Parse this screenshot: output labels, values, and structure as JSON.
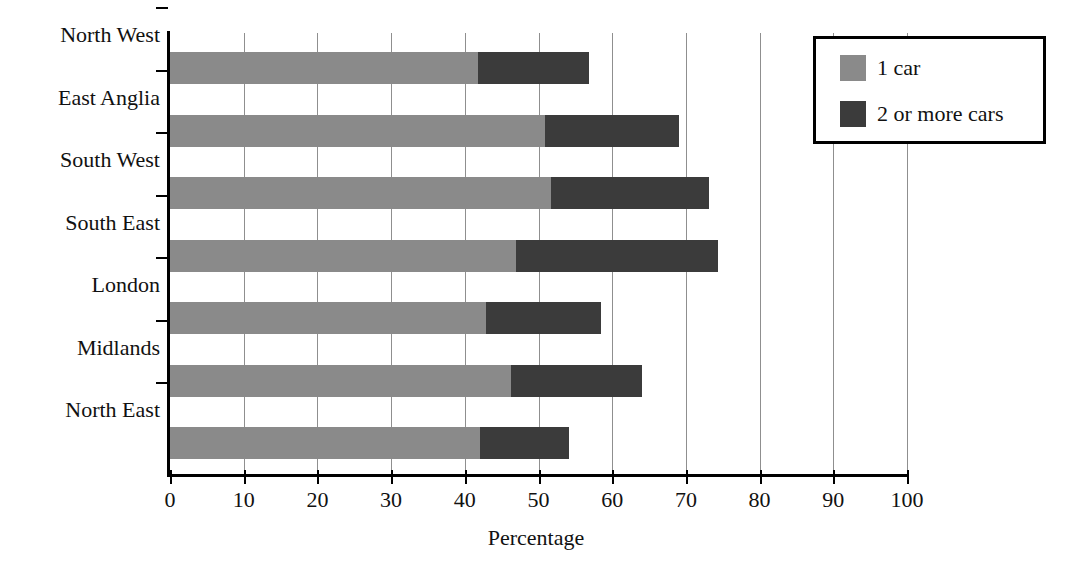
{
  "chart_data": {
    "type": "bar",
    "orientation": "horizontal",
    "stacked": true,
    "title": "",
    "xlabel": "Percentage",
    "ylabel": "",
    "xlim": [
      0,
      100
    ],
    "xticks": [
      "0",
      "10",
      "20",
      "30",
      "40",
      "50",
      "60",
      "70",
      "80",
      "90",
      "100"
    ],
    "grid": "vertical",
    "legend_position": "top-right",
    "categories": [
      "North West",
      "East Anglia",
      "South West",
      "South East",
      "London",
      "Midlands",
      "North East"
    ],
    "series": [
      {
        "name": "1 car",
        "color": "#8a8a8a",
        "values": [
          41.8,
          50.9,
          51.7,
          46.9,
          42.9,
          46.3,
          42.1
        ]
      },
      {
        "name": "2 or more cars",
        "color": "#3b3b3b",
        "values": [
          15.1,
          18.2,
          21.4,
          27.5,
          15.6,
          17.7,
          12.0
        ]
      }
    ],
    "totals": [
      56.9,
      69.1,
      73.1,
      74.4,
      58.5,
      64.0,
      54.1
    ]
  },
  "legend": {
    "items": [
      {
        "label": "1 car",
        "color": "#8a8a8a"
      },
      {
        "label": "2 or more cars",
        "color": "#3b3b3b"
      }
    ]
  },
  "colors": {
    "one_car": "#8a8a8a",
    "two_or_more_cars": "#3b3b3b",
    "axis": "#000000",
    "gridline": "#8f8f8f",
    "background": "#ffffff"
  }
}
